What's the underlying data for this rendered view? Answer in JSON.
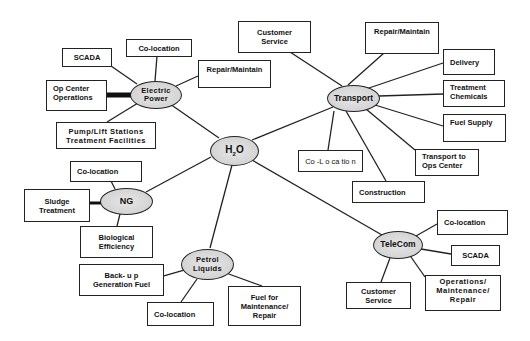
{
  "diagram": {
    "type": "hub-and-spoke infrastructure interdependency map",
    "center": {
      "id": "h2o",
      "label": "H",
      "sub": "2",
      "label_tail": "O"
    },
    "hubs": [
      {
        "id": "electric_power",
        "label": "Electric\nPower",
        "connects_to": "h2o",
        "children": [
          {
            "id": "ep_scada",
            "label": "SCADA"
          },
          {
            "id": "ep_colocation",
            "label": "Co-location"
          },
          {
            "id": "ep_repair",
            "label": "Repair/Maintain"
          },
          {
            "id": "ep_opcenter",
            "label": "Op Center\nOperations",
            "link_style": "thick"
          },
          {
            "id": "ep_pump",
            "label": "Pump/Lift Stations\nTreatment Facilities"
          }
        ]
      },
      {
        "id": "transport",
        "label": "Transport",
        "connects_to": "h2o",
        "children": [
          {
            "id": "t_customer",
            "label": "Customer\nService"
          },
          {
            "id": "t_repair",
            "label": "Repair/Maintain"
          },
          {
            "id": "t_delivery",
            "label": "Delivery"
          },
          {
            "id": "t_chem",
            "label": "Treatment\nChemicals"
          },
          {
            "id": "t_fuel",
            "label": "Fuel Supply"
          },
          {
            "id": "t_ops",
            "label": "Transport to\nOps Center"
          },
          {
            "id": "t_colocation",
            "label": "Co -L o ca tio n"
          },
          {
            "id": "t_construction",
            "label": "Construction"
          }
        ]
      },
      {
        "id": "ng",
        "label": "NG",
        "connects_to": "h2o",
        "children": [
          {
            "id": "ng_colocation",
            "label": "Co-location"
          },
          {
            "id": "ng_sludge",
            "label": "Sludge\nTreatment",
            "link_style": "thick"
          },
          {
            "id": "ng_bio",
            "label": "Biological\nEfficiency"
          }
        ]
      },
      {
        "id": "petrol",
        "label": "Petrol\nLiquids",
        "connects_to": "h2o",
        "children": [
          {
            "id": "p_backup",
            "label": "Back- u p\nGeneration Fuel"
          },
          {
            "id": "p_colocation",
            "label": "Co-location"
          },
          {
            "id": "p_fuel",
            "label": "Fuel for\nMaintenance/\nRepair"
          }
        ]
      },
      {
        "id": "telecom",
        "label": "TeleCom",
        "connects_to": "h2o",
        "children": [
          {
            "id": "tc_colocation",
            "label": "Co-location"
          },
          {
            "id": "tc_scada",
            "label": "SCADA"
          },
          {
            "id": "tc_ops",
            "label": "Operations/\nMaintenance/\nRepair"
          },
          {
            "id": "tc_customer",
            "label": "Customer\nService"
          }
        ]
      }
    ]
  },
  "colors": {
    "line": "#222222",
    "hub_fill": "#d8d8d8",
    "box_fill": "#ffffff",
    "text": "#111111"
  }
}
